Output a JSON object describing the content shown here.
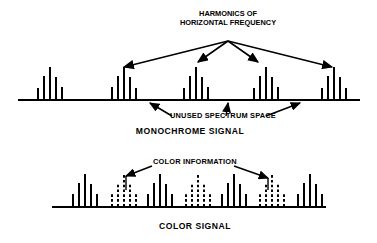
{
  "figure": {
    "title_lines": [
      "HARMONICS OF",
      "HORIZONTAL FREQUENCY"
    ],
    "unused_label": "UNUSED SPECTRUM SPACE",
    "monochrome_title": "MONOCHROME SIGNAL",
    "color_info_label": "COLOR INFORMATION",
    "color_title": "COLOR SIGNAL",
    "ink_color": "#000000",
    "background_color": "#ffffff"
  },
  "chart_data": {
    "type": "bar",
    "title": "HARMONICS OF HORIZONTAL FREQUENCY",
    "xlabel": "",
    "ylabel": "",
    "grid": false,
    "legend": [
      {
        "name": "Luminance harmonics (solid)",
        "style": "solid"
      },
      {
        "name": "Color information sidebands (dashed)",
        "style": "dashed"
      }
    ],
    "panels": [
      {
        "name": "MONOCHROME SIGNAL",
        "baseline_x": [
          18,
          360
        ],
        "baseline_y": 100,
        "note": "Clusters of horizontal-frequency harmonics separated by unused spectrum space",
        "clusters": [
          {
            "center_x": 50,
            "style": "solid",
            "bars": [
              {
                "x": 38,
                "h": 12
              },
              {
                "x": 44,
                "h": 24
              },
              {
                "x": 50,
                "h": 33
              },
              {
                "x": 56,
                "h": 23
              },
              {
                "x": 62,
                "h": 13
              }
            ]
          },
          {
            "center_x": 124,
            "style": "solid",
            "bars": [
              {
                "x": 112,
                "h": 13
              },
              {
                "x": 118,
                "h": 24
              },
              {
                "x": 124,
                "h": 33
              },
              {
                "x": 130,
                "h": 23
              },
              {
                "x": 136,
                "h": 12
              }
            ]
          },
          {
            "center_x": 196,
            "style": "solid",
            "bars": [
              {
                "x": 184,
                "h": 12
              },
              {
                "x": 190,
                "h": 24
              },
              {
                "x": 196,
                "h": 33
              },
              {
                "x": 202,
                "h": 23
              },
              {
                "x": 208,
                "h": 13
              }
            ]
          },
          {
            "center_x": 266,
            "style": "solid",
            "bars": [
              {
                "x": 254,
                "h": 12
              },
              {
                "x": 260,
                "h": 24
              },
              {
                "x": 266,
                "h": 33
              },
              {
                "x": 272,
                "h": 23
              },
              {
                "x": 278,
                "h": 13
              }
            ]
          },
          {
            "center_x": 334,
            "style": "solid",
            "bars": [
              {
                "x": 322,
                "h": 12
              },
              {
                "x": 328,
                "h": 24
              },
              {
                "x": 334,
                "h": 33
              },
              {
                "x": 340,
                "h": 23
              },
              {
                "x": 346,
                "h": 12
              }
            ]
          }
        ],
        "harmonic_arrows": [
          {
            "from_x": 228,
            "from_y": 41,
            "to_x": 124,
            "to_y": 67
          },
          {
            "from_x": 228,
            "from_y": 41,
            "to_x": 198,
            "to_y": 62
          },
          {
            "from_x": 228,
            "from_y": 41,
            "to_x": 258,
            "to_y": 62
          },
          {
            "from_x": 228,
            "from_y": 41,
            "to_x": 332,
            "to_y": 67
          }
        ],
        "unused_arrows": [
          {
            "from_x": 172,
            "from_y": 116,
            "to_x": 150,
            "to_y": 103
          },
          {
            "from_x": 226,
            "from_y": 116,
            "to_x": 228,
            "to_y": 103
          },
          {
            "from_x": 266,
            "from_y": 116,
            "to_x": 300,
            "to_y": 103
          }
        ]
      },
      {
        "name": "COLOR SIGNAL",
        "baseline_x": [
          52,
          326
        ],
        "baseline_y": 207,
        "note": "Color information interleaved in the previously unused spectrum space",
        "clusters": [
          {
            "center_x": 85,
            "style": "solid",
            "bars": [
              {
                "x": 73,
                "h": 13
              },
              {
                "x": 79,
                "h": 24
              },
              {
                "x": 85,
                "h": 33
              },
              {
                "x": 91,
                "h": 23
              },
              {
                "x": 97,
                "h": 13
              }
            ]
          },
          {
            "center_x": 124,
            "style": "dashed",
            "bars": [
              {
                "x": 112,
                "h": 13
              },
              {
                "x": 118,
                "h": 24
              },
              {
                "x": 124,
                "h": 32
              },
              {
                "x": 130,
                "h": 23
              },
              {
                "x": 136,
                "h": 13
              }
            ]
          },
          {
            "center_x": 160,
            "style": "solid",
            "bars": [
              {
                "x": 148,
                "h": 13
              },
              {
                "x": 154,
                "h": 24
              },
              {
                "x": 160,
                "h": 33
              },
              {
                "x": 166,
                "h": 23
              },
              {
                "x": 172,
                "h": 13
              }
            ]
          },
          {
            "center_x": 198,
            "style": "dashed",
            "bars": [
              {
                "x": 186,
                "h": 13
              },
              {
                "x": 192,
                "h": 24
              },
              {
                "x": 198,
                "h": 32
              },
              {
                "x": 204,
                "h": 23
              },
              {
                "x": 210,
                "h": 13
              }
            ]
          },
          {
            "center_x": 234,
            "style": "solid",
            "bars": [
              {
                "x": 222,
                "h": 13
              },
              {
                "x": 228,
                "h": 24
              },
              {
                "x": 234,
                "h": 33
              },
              {
                "x": 240,
                "h": 23
              },
              {
                "x": 246,
                "h": 13
              }
            ]
          },
          {
            "center_x": 272,
            "style": "dashed",
            "bars": [
              {
                "x": 260,
                "h": 13
              },
              {
                "x": 266,
                "h": 24
              },
              {
                "x": 272,
                "h": 32
              },
              {
                "x": 278,
                "h": 23
              },
              {
                "x": 284,
                "h": 13
              }
            ]
          },
          {
            "center_x": 310,
            "style": "solid",
            "bars": [
              {
                "x": 298,
                "h": 13
              },
              {
                "x": 304,
                "h": 24
              },
              {
                "x": 310,
                "h": 33
              },
              {
                "x": 316,
                "h": 23
              },
              {
                "x": 322,
                "h": 13
              }
            ]
          }
        ],
        "color_arrows": [
          {
            "from_x": 152,
            "from_y": 166,
            "to_x": 126,
            "to_y": 176
          },
          {
            "from_x": 234,
            "from_y": 166,
            "to_x": 268,
            "to_y": 178
          }
        ],
        "leader_lines": [
          {
            "x": 126,
            "y1": 176,
            "y2": 190
          },
          {
            "x": 268,
            "y1": 178,
            "y2": 190
          }
        ]
      }
    ]
  }
}
